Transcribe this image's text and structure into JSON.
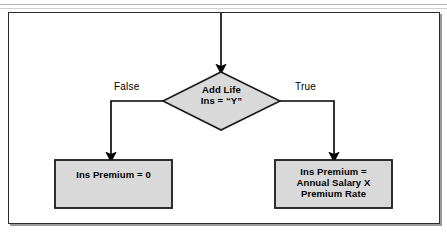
{
  "figure": {
    "type": "flowchart",
    "background": "#ffffff",
    "frame_border_color": "#2b2b2b",
    "node_fill": "#d9d9d9",
    "node_stroke": "#1a1a1a",
    "connector_color": "#000000"
  },
  "nodes": {
    "decision": {
      "shape": "diamond",
      "label": "Add Life\nIns = “Y”",
      "lines": [
        "Add Life",
        "Ins = “Y”"
      ]
    },
    "false_branch_box": {
      "shape": "rectangle",
      "label": "Ins Premium = 0",
      "lines": [
        "Ins Premium = 0"
      ]
    },
    "true_branch_box": {
      "shape": "rectangle",
      "label": "Ins Premium =\nAnnual Salary X\nPremium Rate",
      "lines": [
        "Ins Premium =",
        "Annual Salary X",
        "Premium Rate"
      ]
    }
  },
  "edges": {
    "entry": {
      "label": ""
    },
    "false": {
      "label": "False"
    },
    "true": {
      "label": "True"
    }
  }
}
